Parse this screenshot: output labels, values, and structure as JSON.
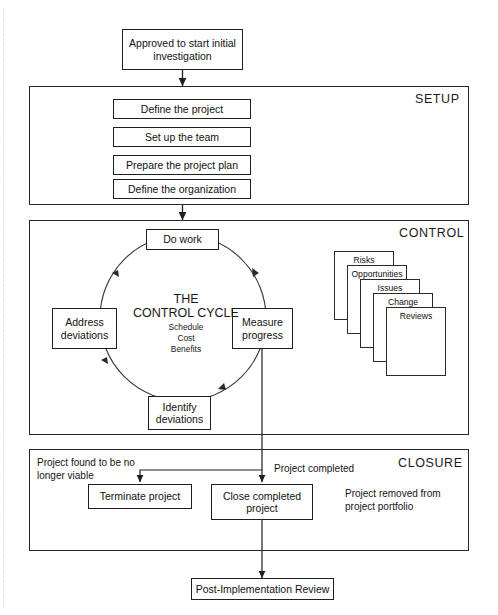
{
  "diagram": {
    "entry": {
      "label": "Approved to start initial investigation"
    },
    "exit": {
      "label": "Post-Implementation Review"
    },
    "sections": [
      {
        "id": "setup",
        "label": "SETUP"
      },
      {
        "id": "control",
        "label": "CONTROL"
      },
      {
        "id": "closure",
        "label": "CLOSURE"
      }
    ],
    "setup": {
      "steps": [
        {
          "label": "Define the project"
        },
        {
          "label": "Set up the team"
        },
        {
          "label": "Prepare the project plan"
        },
        {
          "label": "Define the organization"
        }
      ]
    },
    "control": {
      "cycle_title_line1": "THE",
      "cycle_title_line2": "CONTROL CYCLE",
      "cycle_measures": [
        "Schedule",
        "Cost",
        "Benefits"
      ],
      "nodes": [
        {
          "id": "do-work",
          "label": "Do work"
        },
        {
          "id": "measure-progress",
          "label": "Measure progress"
        },
        {
          "id": "identify-deviations",
          "label": "Identify deviations"
        },
        {
          "id": "address-deviations",
          "label": "Address deviations"
        }
      ],
      "logs": [
        {
          "label": "Risks"
        },
        {
          "label": "Opportunities"
        },
        {
          "label": "Issues"
        },
        {
          "label": "Change"
        },
        {
          "label": "Reviews"
        }
      ]
    },
    "closure": {
      "branch_label_terminate": "Project found to be no longer viable",
      "branch_label_complete": "Project completed",
      "note": "Project removed from project portfolio",
      "nodes": [
        {
          "id": "terminate-project",
          "label": "Terminate project"
        },
        {
          "id": "close-completed-project",
          "label": "Close completed project"
        }
      ]
    },
    "colors": {
      "stroke": "#1f1f1f",
      "background": "#ffffff",
      "text": "#141414"
    }
  }
}
